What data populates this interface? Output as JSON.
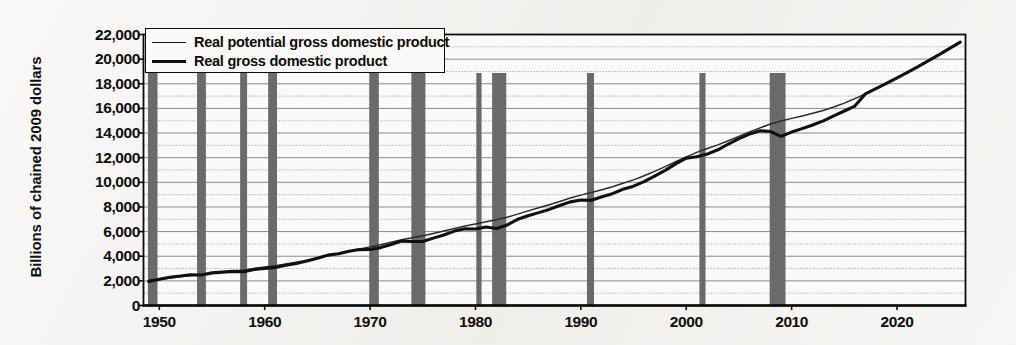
{
  "chart_data": {
    "type": "line",
    "title": "",
    "subtitle": "",
    "xlabel": "",
    "ylabel": "Billions of chained 2009 dollars",
    "xlim": [
      1948.5,
      2026.5
    ],
    "ylim": [
      0,
      22000
    ],
    "y_ticks": [
      "0",
      "2,000",
      "4,000",
      "6,000",
      "8,000",
      "10,000",
      "12,000",
      "14,000",
      "16,000",
      "18,000",
      "20,000",
      "22,000"
    ],
    "y_tick_values": [
      0,
      2000,
      4000,
      6000,
      8000,
      10000,
      12000,
      14000,
      16000,
      18000,
      20000,
      22000
    ],
    "x_ticks": [
      "1950",
      "1960",
      "1970",
      "1980",
      "1990",
      "2000",
      "2010",
      "2020"
    ],
    "x_tick_values": [
      1950,
      1960,
      1970,
      1980,
      1990,
      2000,
      2010,
      2020
    ],
    "grid": "horizontal-solid-at-even-thousands-dotted-at-odd",
    "legend_position": "top-left-inside",
    "legend": [
      {
        "label": "Real potential gross domestic product",
        "style": "thin-line",
        "color": "#2b2b2b"
      },
      {
        "label": "Real gross domestic product",
        "style": "thick-line",
        "color": "#101010"
      }
    ],
    "series": [
      {
        "name": "Real potential gross domestic product",
        "x": [
          1949,
          1950,
          1951,
          1952,
          1953,
          1954,
          1955,
          1956,
          1957,
          1958,
          1959,
          1960,
          1961,
          1962,
          1963,
          1964,
          1965,
          1966,
          1967,
          1968,
          1969,
          1970,
          1971,
          1972,
          1973,
          1974,
          1975,
          1976,
          1977,
          1978,
          1979,
          1980,
          1981,
          1982,
          1983,
          1984,
          1985,
          1986,
          1987,
          1988,
          1989,
          1990,
          1991,
          1992,
          1993,
          1994,
          1995,
          1996,
          1997,
          1998,
          1999,
          2000,
          2001,
          2002,
          2003,
          2004,
          2005,
          2006,
          2007,
          2008,
          2009,
          2010,
          2011,
          2012,
          2013,
          2014,
          2015,
          2016,
          2017,
          2018,
          2019,
          2020,
          2021,
          2022,
          2023,
          2024,
          2025,
          2026
        ],
        "y": [
          2030,
          2120,
          2230,
          2330,
          2430,
          2510,
          2620,
          2720,
          2810,
          2890,
          3010,
          3120,
          3230,
          3370,
          3510,
          3670,
          3840,
          4030,
          4210,
          4400,
          4590,
          4760,
          4940,
          5130,
          5330,
          5500,
          5660,
          5840,
          6040,
          6250,
          6450,
          6620,
          6800,
          6970,
          7170,
          7420,
          7680,
          7930,
          8180,
          8450,
          8720,
          8960,
          9170,
          9390,
          9640,
          9920,
          10200,
          10530,
          10890,
          11270,
          11670,
          12070,
          12430,
          12740,
          13040,
          13380,
          13730,
          14080,
          14420,
          14730,
          14980,
          15190,
          15390,
          15600,
          15830,
          16110,
          16430,
          16790,
          17180,
          17600,
          18030,
          18470,
          18930,
          19400,
          19880,
          20370,
          20870,
          21380
        ]
      },
      {
        "name": "Real gross domestic product",
        "x": [
          1949,
          1950,
          1951,
          1952,
          1953,
          1954,
          1955,
          1956,
          1957,
          1958,
          1959,
          1960,
          1961,
          1962,
          1963,
          1964,
          1965,
          1966,
          1967,
          1968,
          1969,
          1970,
          1971,
          1972,
          1973,
          1974,
          1975,
          1976,
          1977,
          1978,
          1979,
          1980,
          1981,
          1982,
          1983,
          1984,
          1985,
          1986,
          1987,
          1988,
          1989,
          1990,
          1991,
          1992,
          1993,
          1994,
          1995,
          1996,
          1997,
          1998,
          1999,
          2000,
          2001,
          2002,
          2003,
          2004,
          2005,
          2006,
          2007,
          2008,
          2009,
          2010,
          2011,
          2012,
          2013,
          2014,
          2015,
          2016,
          2017,
          2018,
          2019,
          2020,
          2021,
          2022,
          2023,
          2024,
          2025,
          2026
        ],
        "y": [
          1960,
          2130,
          2300,
          2390,
          2500,
          2480,
          2650,
          2710,
          2770,
          2740,
          2930,
          3010,
          3080,
          3270,
          3410,
          3610,
          3840,
          4090,
          4200,
          4400,
          4540,
          4550,
          4700,
          4950,
          5230,
          5200,
          5190,
          5470,
          5720,
          6040,
          6230,
          6210,
          6370,
          6250,
          6530,
          7000,
          7290,
          7540,
          7800,
          8120,
          8410,
          8560,
          8540,
          8830,
          9080,
          9440,
          9690,
          10060,
          10510,
          10970,
          11500,
          11960,
          12070,
          12290,
          12640,
          13110,
          13550,
          13910,
          14190,
          14120,
          13730,
          14080,
          14360,
          14650,
          14990,
          15390,
          15790,
          16190,
          17180,
          17600,
          18030,
          18470,
          18930,
          19400,
          19880,
          20370,
          20870,
          21380
        ]
      }
    ],
    "shaded_regions_label": "recession bars",
    "shaded_regions": [
      {
        "start": 1948.92,
        "end": 1949.83
      },
      {
        "start": 1953.58,
        "end": 1954.42
      },
      {
        "start": 1957.67,
        "end": 1958.33
      },
      {
        "start": 1960.33,
        "end": 1961.17
      },
      {
        "start": 1969.92,
        "end": 1970.83
      },
      {
        "start": 1973.92,
        "end": 1975.25
      },
      {
        "start": 1980.08,
        "end": 1980.58
      },
      {
        "start": 1981.58,
        "end": 1982.92
      },
      {
        "start": 1990.58,
        "end": 1991.25
      },
      {
        "start": 2001.25,
        "end": 2001.83
      },
      {
        "start": 2007.92,
        "end": 2009.42
      }
    ],
    "colors": {
      "recession_bar": "#6a6a6a",
      "gridline_solid": "#8a8a8a",
      "gridline_dotted": "#a0a0a0",
      "axis": "#0b0b0b",
      "plot_background": "#fbfaf8",
      "page_background": "#f2f1ee"
    }
  }
}
